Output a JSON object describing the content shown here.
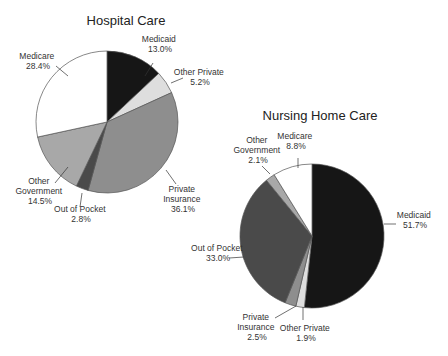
{
  "chart_data": [
    {
      "type": "pie",
      "title": "Hospital Care",
      "slices": [
        {
          "label": "Medicaid",
          "value": 13.0,
          "color": "#161616"
        },
        {
          "label": "Other Private",
          "value": 5.2,
          "color": "#dedede"
        },
        {
          "label": "Private Insurance",
          "value": 36.1,
          "color": "#8e8e8e"
        },
        {
          "label": "Out of Pocket",
          "value": 2.8,
          "color": "#4a4a4a"
        },
        {
          "label": "Other Government",
          "value": 14.5,
          "color": "#a8a8a8"
        },
        {
          "label": "Medicare",
          "value": 28.4,
          "color": "#ffffff"
        }
      ]
    },
    {
      "type": "pie",
      "title": "Nursing Home Care",
      "slices": [
        {
          "label": "Medicaid",
          "value": 51.7,
          "color": "#161616"
        },
        {
          "label": "Other Private",
          "value": 1.9,
          "color": "#dedede"
        },
        {
          "label": "Private Insurance",
          "value": 2.5,
          "color": "#8e8e8e"
        },
        {
          "label": "Out of Pocket",
          "value": 33.0,
          "color": "#4a4a4a"
        },
        {
          "label": "Other Government",
          "value": 2.1,
          "color": "#a8a8a8"
        },
        {
          "label": "Medicare",
          "value": 8.8,
          "color": "#ffffff"
        }
      ]
    }
  ],
  "hospital": {
    "title": "Hospital Care",
    "labels": {
      "medicaid": [
        "Medicaid",
        "13.0%"
      ],
      "other_private": [
        "Other Private",
        "5.2%"
      ],
      "private_insurance": [
        "Private",
        "Insurance",
        "36.1%"
      ],
      "out_of_pocket": [
        "Out of Pocket",
        "2.8%"
      ],
      "other_government": [
        "Other",
        "Government",
        "14.5%"
      ],
      "medicare": [
        "Medicare",
        "28.4%"
      ]
    }
  },
  "nursing": {
    "title": "Nursing Home Care",
    "labels": {
      "medicaid": [
        "Medicaid",
        "51.7%"
      ],
      "other_private": [
        "Other Private",
        "1.9%"
      ],
      "private_insurance": [
        "Private",
        "Insurance",
        "2.5%"
      ],
      "out_of_pocket": [
        "Out of Pocket",
        "33.0%"
      ],
      "other_government": [
        "Other",
        "Government",
        "2.1%"
      ],
      "medicare": [
        "Medicare",
        "8.8%"
      ]
    }
  }
}
